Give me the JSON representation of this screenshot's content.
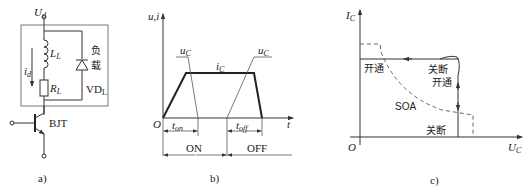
{
  "panel_a": {
    "caption": "a)",
    "supply_label": "U",
    "supply_sub": "d",
    "current_label": "i",
    "current_sub": "d",
    "inductor_label": "L",
    "inductor_sub": "L",
    "resistor_label": "R",
    "resistor_sub": "L",
    "load_label_1": "负",
    "load_label_2": "载",
    "diode_label": "VD",
    "diode_sub": "L",
    "transistor_label": "BJT"
  },
  "panel_b": {
    "caption": "b)",
    "y_axis_label": "u,i",
    "x_axis_label": "t",
    "origin_label": "O",
    "current_label": "i",
    "current_sub": "C",
    "voltage_label_on": "u",
    "voltage_sub_on": "C",
    "voltage_label_off": "u",
    "voltage_sub_off": "C",
    "t_on_label": "t",
    "t_on_sub": "on",
    "t_off_label": "t",
    "t_off_sub": "off",
    "on_label": "ON",
    "off_label": "OFF"
  },
  "panel_c": {
    "caption": "c)",
    "y_axis_label": "I",
    "y_axis_sub": "C",
    "x_axis_label": "U",
    "x_axis_sub": "C",
    "origin_label": "O",
    "turn_on_label_left": "开通",
    "turn_off_label_upper": "关断",
    "turn_on_label_right": "开通",
    "turn_off_label_lower": "关断",
    "soa_label": "SOA"
  }
}
